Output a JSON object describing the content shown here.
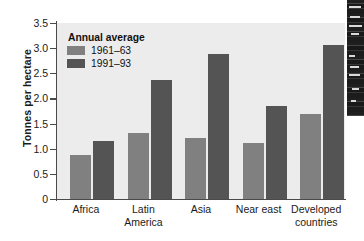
{
  "chart_data": {
    "type": "bar",
    "title": "",
    "xlabel": "",
    "ylabel": "Tonnes per hectare",
    "ylim": [
      0,
      3.5
    ],
    "ytick_labels": [
      "3.5",
      "3.0",
      "2.5",
      "2.0",
      "1.5",
      "1.0",
      "0.5",
      "0"
    ],
    "ytick_values": [
      3.5,
      3.0,
      2.5,
      2.0,
      1.5,
      1.0,
      0.5,
      0
    ],
    "grid": false,
    "legend_position": "top-left",
    "legend_title": "Annual average",
    "categories": [
      "Africa",
      "Latin America",
      "Asia",
      "Near east",
      "Developed countries"
    ],
    "category_lines": [
      [
        "Africa"
      ],
      [
        "Latin",
        "America"
      ],
      [
        "Asia"
      ],
      [
        "Near east"
      ],
      [
        "Developed",
        "countries"
      ]
    ],
    "series": [
      {
        "name": "1961–63",
        "color": "#808080",
        "values": [
          0.88,
          1.31,
          1.21,
          1.12,
          1.7
        ]
      },
      {
        "name": "1991–93",
        "color": "#545454",
        "values": [
          1.16,
          2.37,
          2.88,
          1.84,
          3.07
        ]
      }
    ]
  },
  "colors": {
    "plot_background": "#ececec",
    "axis": "#4a4a4a",
    "text": "#1a1a1a",
    "series_1961_63": "#808080",
    "series_1991_93": "#545454"
  }
}
